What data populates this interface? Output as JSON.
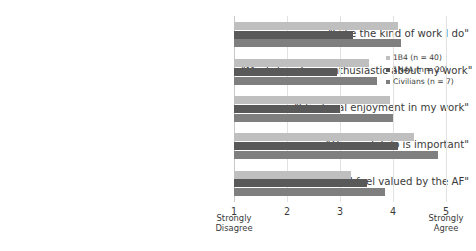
{
  "chart_data": {
    "type": "bar",
    "orientation": "horizontal",
    "title": "",
    "xlabel": "",
    "ylabel": "",
    "xlim": [
      1,
      5
    ],
    "grid": true,
    "legend_position": "right",
    "categories": [
      "\"I like the kind of work I do\"",
      "\"Most days I am enthusiastic about my work\"",
      "\"I find real enjoyment in my work\"",
      "\"The work I do is important\"",
      "\"I feel valued by the AF\""
    ],
    "series": [
      {
        "name": "1B4 (n = 40)",
        "color": "#bfbfbf",
        "values": [
          4.1,
          3.55,
          3.95,
          4.4,
          3.2
        ]
      },
      {
        "name": "1N4A (n = 20)",
        "color": "#595959",
        "values": [
          3.25,
          2.95,
          3.0,
          4.1,
          3.5
        ]
      },
      {
        "name": "Civilians (n = 7)",
        "color": "#7f7f7f",
        "values": [
          4.15,
          3.7,
          4.0,
          4.85,
          3.85
        ]
      }
    ],
    "xticks": [
      {
        "value": 1,
        "label": "1",
        "sublabel": "Strongly\nDisagree"
      },
      {
        "value": 2,
        "label": "2",
        "sublabel": ""
      },
      {
        "value": 3,
        "label": "3",
        "sublabel": ""
      },
      {
        "value": 4,
        "label": "4",
        "sublabel": ""
      },
      {
        "value": 5,
        "label": "5",
        "sublabel": "Strongly\nAgree"
      }
    ]
  },
  "axis": {
    "tick_1": "1",
    "tick_2": "2",
    "tick_3": "3",
    "tick_4": "4",
    "tick_5": "5",
    "low_anchor_line1": "Strongly",
    "low_anchor_line2": "Disagree",
    "high_anchor_line1": "Strongly",
    "high_anchor_line2": "Agree"
  },
  "legend": {
    "items": [
      {
        "label": "1B4 (n = 40)",
        "color": "#bfbfbf"
      },
      {
        "label": "1N4A (n = 20)",
        "color": "#595959"
      },
      {
        "label": "Civilians (n = 7)",
        "color": "#7f7f7f"
      }
    ]
  }
}
